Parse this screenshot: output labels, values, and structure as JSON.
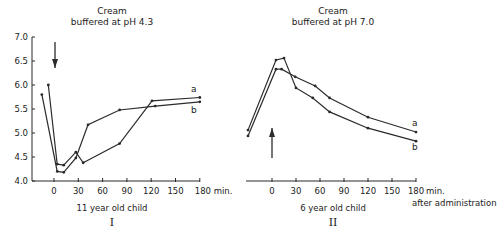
{
  "chart_data": [
    {
      "type": "line",
      "title": "Cream buffered at pH 4.3",
      "title_lines": [
        "Cream",
        "buffered at pH 4.3"
      ],
      "subtitle": "11 year old child",
      "panel_label": "I",
      "xlabel": "min.",
      "ylabel": "",
      "xlim": [
        -25,
        180
      ],
      "ylim": [
        4.0,
        7.0
      ],
      "xticks": [
        0,
        30,
        60,
        90,
        120,
        150,
        180
      ],
      "xtick_labels": [
        "0",
        "30",
        "60",
        "90",
        "120",
        "150",
        "180 min."
      ],
      "yticks": [
        4.0,
        4.5,
        5.0,
        5.5,
        6.0,
        6.5,
        7.0
      ],
      "ytick_labels": [
        "4.0",
        "4.5",
        "5.0",
        "5.5",
        "6.0",
        "6.5",
        "7.0"
      ],
      "annotation": "downward arrow at t=0 (application)",
      "series": [
        {
          "name": "a",
          "x": [
            -7,
            4,
            12,
            27,
            36,
            81,
            121,
            180
          ],
          "y": [
            6.0,
            4.35,
            4.33,
            4.6,
            4.38,
            4.78,
            5.67,
            5.74
          ]
        },
        {
          "name": "b",
          "x": [
            -15,
            4,
            12,
            27,
            42,
            81,
            125,
            180
          ],
          "y": [
            5.8,
            4.2,
            4.18,
            4.48,
            5.17,
            5.48,
            5.56,
            5.65
          ]
        }
      ]
    },
    {
      "type": "line",
      "title": "Cream buffered at pH 7.0",
      "title_lines": [
        "Cream",
        "buffered at pH 7.0"
      ],
      "subtitle": "6 year old child",
      "panel_label": "II",
      "xlabel": "min. after administration",
      "xlabel_lines": [
        "min.",
        "after administration"
      ],
      "xlim": [
        -30,
        180
      ],
      "ylim": [
        4.0,
        7.0
      ],
      "xticks": [
        0,
        30,
        60,
        90,
        120,
        150,
        180
      ],
      "xtick_labels": [
        "0",
        "30",
        "60",
        "90",
        "120",
        "150",
        "180"
      ],
      "annotation": "upward arrow at t=0 (application)",
      "series": [
        {
          "name": "a",
          "x": [
            -30,
            5,
            12,
            29,
            54,
            72,
            120,
            180
          ],
          "y": [
            4.94,
            6.33,
            6.33,
            6.17,
            5.98,
            5.73,
            5.33,
            5.02
          ]
        },
        {
          "name": "b",
          "x": [
            -30,
            5,
            15,
            30,
            51,
            72,
            120,
            180
          ],
          "y": [
            5.06,
            6.52,
            6.56,
            5.94,
            5.73,
            5.44,
            5.1,
            4.83
          ]
        }
      ]
    }
  ],
  "colors": {
    "line": "#2b2b2b",
    "text": "#222222",
    "background": "#ffffff"
  }
}
